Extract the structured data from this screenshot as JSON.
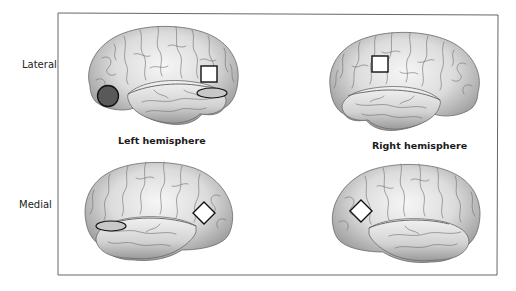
{
  "figure": {
    "row_labels": {
      "lateral": "Lateral",
      "medial": "Medial"
    },
    "hemisphere_labels": {
      "left": "Left hemisphere",
      "right": "Right hemisphere"
    },
    "panels": [
      {
        "id": "left-lateral",
        "view": "Lateral",
        "hemisphere": "Left hemisphere",
        "markers": [
          {
            "shape": "circle",
            "fill": "#595959",
            "description": "filled dark circle, inferior frontal region"
          },
          {
            "shape": "square",
            "fill": "#ffffff",
            "description": "open square, posterior superior temporal / parietal region"
          },
          {
            "shape": "ellipse",
            "fill": "#c8c8c8",
            "description": "grey ellipse, posterior temporal region"
          }
        ]
      },
      {
        "id": "right-lateral",
        "view": "Lateral",
        "hemisphere": "Right hemisphere",
        "markers": [
          {
            "shape": "square",
            "fill": "#ffffff",
            "description": "open square, temporo-parietal region"
          }
        ]
      },
      {
        "id": "left-medial",
        "view": "Medial",
        "hemisphere": "Left hemisphere",
        "markers": [
          {
            "shape": "ellipse",
            "fill": "#c8c8c8",
            "description": "grey ellipse, anterior region"
          },
          {
            "shape": "diamond",
            "fill": "#ffffff",
            "description": "open diamond, posterior region"
          }
        ]
      },
      {
        "id": "right-medial",
        "view": "Medial",
        "hemisphere": "Right hemisphere",
        "markers": [
          {
            "shape": "diamond",
            "fill": "#ffffff",
            "description": "open diamond, posterior region"
          }
        ]
      }
    ],
    "colors": {
      "frame": "#555555",
      "marker_stroke": "#111111",
      "circle_fill": "#595959",
      "ellipse_fill": "#c8c8c8",
      "brain_light": "#f4f4f4",
      "brain_dark": "#9a9a9a",
      "sulci": "#6e6e6e"
    }
  }
}
